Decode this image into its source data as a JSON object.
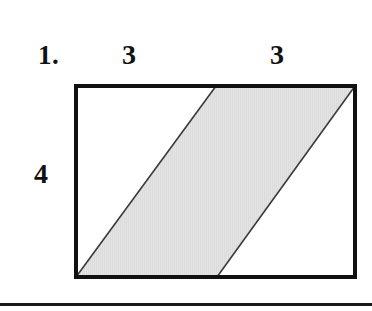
{
  "page": {
    "background_color": "#ffffff",
    "width": 372,
    "height": 311
  },
  "problem": {
    "number_label": "1.",
    "type": "geometry-area-figure"
  },
  "labels": {
    "item_number": "1.",
    "top_left_segment": "3",
    "top_right_segment": "3",
    "left_side": "4"
  },
  "figure": {
    "outer_shape": "rectangle",
    "inner_shape": "parallelogram",
    "shaded_region_fill": "#e2e2e2",
    "outline_color": "#111111",
    "diagonal_color": "#3a3a3a",
    "border_width_px": 4,
    "diagonal_width_px": 1.6,
    "rectangle": {
      "width_units": 6,
      "height_units": 4,
      "top_divisions": [
        "3",
        "3"
      ]
    },
    "parallelogram_vertices_px": [
      [
        2,
        193
      ],
      [
        142,
        2
      ],
      [
        281,
        2
      ],
      [
        143,
        193
      ]
    ]
  },
  "divider": {
    "color": "#1a1a1a",
    "thickness_px": 3
  }
}
